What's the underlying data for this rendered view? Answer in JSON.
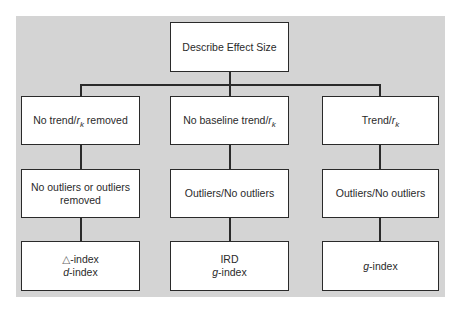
{
  "diagram": {
    "type": "tree-flowchart",
    "root": {
      "label": "Describe Effect Size"
    },
    "columns": [
      {
        "level1": {
          "prefix": "No trend/",
          "var": "r",
          "sub": "k",
          "suffix": " removed"
        },
        "level2": {
          "line1": "No outliers or outliers",
          "line2": "removed"
        },
        "level3": {
          "line1_symbol": "△",
          "line1_text": "-index",
          "line2_italic": "d",
          "line2_text": "-index"
        }
      },
      {
        "level1": {
          "prefix": "No baseline trend/",
          "var": "r",
          "sub": "k",
          "suffix": ""
        },
        "level2": {
          "line1": "Outliers/No outliers"
        },
        "level3": {
          "line1_text": "IRD",
          "line2_italic": "g",
          "line2_text": "-index"
        }
      },
      {
        "level1": {
          "prefix": "Trend/",
          "var": "r",
          "sub": "k",
          "suffix": ""
        },
        "level2": {
          "line1": "Outliers/No outliers"
        },
        "level3": {
          "line1_italic": "g",
          "line1_text": "-index"
        }
      }
    ],
    "colors": {
      "panel_background": "#d4d4d4",
      "box_fill": "#ffffff",
      "line_color": "#2a2a2a"
    }
  }
}
